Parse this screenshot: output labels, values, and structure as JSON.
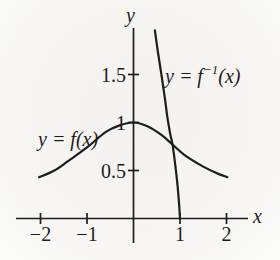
{
  "figure": {
    "ink_color": "#1e1d1b",
    "background_color": "#f5f4f1"
  },
  "labels": {
    "x_axis": "x",
    "y_axis": "y",
    "f_prefix": "y = f",
    "f_sup": "",
    "f_suffix": "(x)",
    "finv_prefix": "y = f",
    "finv_sup": "−1",
    "finv_suffix": "(x)"
  },
  "chart_data": {
    "type": "line",
    "title": "",
    "xlabel": "x",
    "ylabel": "y",
    "x_range": [
      -2.5,
      2.55
    ],
    "y_range": [
      0,
      2.05
    ],
    "grid": false,
    "legend_position": "inline annotations next to curves",
    "x_ticks": [
      {
        "value": -2,
        "label": "−2"
      },
      {
        "value": -1,
        "label": "−1"
      },
      {
        "value": 1,
        "label": "1"
      },
      {
        "value": 2,
        "label": "2"
      }
    ],
    "y_ticks": [
      {
        "value": 0.5,
        "label": "0.5"
      },
      {
        "value": 1,
        "label": "1"
      },
      {
        "value": 1.5,
        "label": "1.5"
      }
    ],
    "series": [
      {
        "name": "y = f(x)",
        "description": "bell-shaped curve peaking at (0, 1)",
        "points": [
          [
            -2.03,
            0.43
          ],
          [
            -1.7,
            0.5
          ],
          [
            -1.4,
            0.6
          ],
          [
            -1.0,
            0.74
          ],
          [
            -0.6,
            0.9
          ],
          [
            -0.3,
            0.97
          ],
          [
            0,
            1.0
          ],
          [
            0.3,
            0.96
          ],
          [
            0.6,
            0.87
          ],
          [
            0.84,
            0.77
          ],
          [
            1.1,
            0.66
          ],
          [
            1.5,
            0.54
          ],
          [
            1.8,
            0.47
          ],
          [
            2.02,
            0.43
          ]
        ]
      },
      {
        "name": "y = f⁻¹(x)",
        "description": "steep decreasing curve, inverse of f, meeting the x-axis at (1, 0)",
        "points": [
          [
            0.46,
            1.96
          ],
          [
            0.52,
            1.75
          ],
          [
            0.6,
            1.5
          ],
          [
            0.67,
            1.27
          ],
          [
            0.73,
            1.05
          ],
          [
            0.79,
            0.88
          ],
          [
            0.84,
            0.77
          ],
          [
            0.9,
            0.55
          ],
          [
            0.95,
            0.33
          ],
          [
            0.985,
            0.12
          ],
          [
            1.0,
            0.0
          ]
        ]
      }
    ],
    "intersection_point": [
      0.84,
      0.77
    ]
  }
}
